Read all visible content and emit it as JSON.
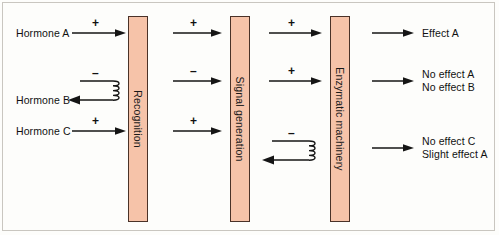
{
  "diagram": {
    "background_color": "#fdfdfb",
    "box_fill_color": "#f6c3a9",
    "box_border_color": "#4a3228",
    "ink_color": "#151515",
    "stages": [
      {
        "id": "recognition",
        "label": "Recognition"
      },
      {
        "id": "signal-generation",
        "label": "Signal generation"
      },
      {
        "id": "enzymatic-machinery",
        "label": "Enzymatic machinery"
      }
    ],
    "inputs": [
      {
        "id": "hormone-a",
        "label": "Hormone A"
      },
      {
        "id": "hormone-b",
        "label": "Hormone B"
      },
      {
        "id": "hormone-c",
        "label": "Hormone C"
      }
    ],
    "outputs": [
      {
        "id": "effect-a",
        "lines": [
          "Effect A"
        ],
        "line1": "Effect A",
        "line2": ""
      },
      {
        "id": "no-effect-ab",
        "lines": [
          "No effect A",
          "No effect B"
        ],
        "line1": "No effect A",
        "line2": "No effect B"
      },
      {
        "id": "no-effect-c",
        "lines": [
          "No effect C",
          "Slight effect A"
        ],
        "line1": "No effect C",
        "line2": "Slight effect A"
      }
    ],
    "signs": {
      "plus": "+",
      "minus": "–"
    },
    "rows": [
      {
        "id": "row-a",
        "input": "Hormone A",
        "segments": [
          {
            "from": "hormone-a",
            "to": "recognition",
            "sign": "+"
          },
          {
            "from": "recognition",
            "to": "signal-generation",
            "sign": "+"
          },
          {
            "from": "signal-generation",
            "to": "enzymatic-machinery",
            "sign": "+"
          },
          {
            "from": "enzymatic-machinery",
            "to": "effect-a",
            "sign": ""
          }
        ],
        "output": "Effect A"
      },
      {
        "id": "row-b",
        "input": "Hormone B",
        "segments": [
          {
            "from": "hormone-b",
            "to": "recognition",
            "sign": "–",
            "blocked": true,
            "returns": true
          },
          {
            "from": "recognition",
            "to": "signal-generation",
            "sign": "–"
          },
          {
            "from": "signal-generation",
            "to": "enzymatic-machinery",
            "sign": "+"
          },
          {
            "from": "enzymatic-machinery",
            "to": "no-effect-ab",
            "sign": ""
          }
        ],
        "output": "No effect A / No effect B"
      },
      {
        "id": "row-c",
        "input": "Hormone C",
        "segments": [
          {
            "from": "hormone-c",
            "to": "recognition",
            "sign": "+"
          },
          {
            "from": "recognition",
            "to": "signal-generation",
            "sign": "+"
          },
          {
            "from": "signal-generation",
            "to": "enzymatic-machinery",
            "sign": "–",
            "blocked": true,
            "returns": true
          },
          {
            "from": "enzymatic-machinery",
            "to": "no-effect-c",
            "sign": ""
          }
        ],
        "output": "No effect C / Slight effect A"
      }
    ]
  }
}
